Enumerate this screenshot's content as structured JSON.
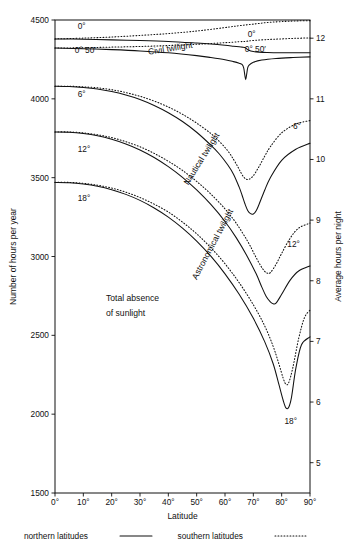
{
  "chart_data": {
    "type": "line",
    "title": "",
    "xlabel": "Latitude",
    "ylabel": "Number of hours per year",
    "ylabel_right": "Average hours per night",
    "xlim": [
      0,
      90
    ],
    "ylim": [
      1500,
      4500
    ],
    "ylim_right": [
      4.5,
      12.3
    ],
    "grid": false,
    "x_ticks": [
      "0°",
      "10°",
      "20°",
      "30°",
      "40°",
      "50°",
      "60°",
      "70°",
      "80°",
      "90°"
    ],
    "x_tick_values": [
      0,
      10,
      20,
      30,
      40,
      50,
      60,
      70,
      80,
      90
    ],
    "y_ticks": [
      "1500",
      "2000",
      "2500",
      "3000",
      "3500",
      "4000",
      "4500"
    ],
    "y_tick_values": [
      1500,
      2000,
      2500,
      3000,
      3500,
      4000,
      4500
    ],
    "y_ticks_right": [
      "5",
      "6",
      "7",
      "8",
      "9",
      "10",
      "11",
      "12"
    ],
    "y_tick_values_right": [
      5,
      6,
      7,
      8,
      9,
      10,
      11,
      12
    ],
    "legend": [
      {
        "label": "northern latitudes",
        "style": "solid"
      },
      {
        "label": "southern latitudes",
        "style": "dotted"
      }
    ],
    "legend_position": "below-axes",
    "zone_labels": [
      {
        "text": "Civil twilight",
        "x": 33,
        "y": 4280,
        "rotation": -9
      },
      {
        "text": "Nautical twilight",
        "x": 47,
        "y": 3450,
        "rotation": -58
      },
      {
        "text": "Astronomical twilight",
        "x": 50,
        "y": 2850,
        "rotation": -62
      },
      {
        "text": "Total absence",
        "x": 18,
        "y": 2720,
        "rotation": 0
      },
      {
        "text": "of sunlight",
        "x": 18,
        "y": 2620,
        "rotation": 0
      }
    ],
    "curve_labels_left": [
      {
        "text": "0°",
        "x": 8,
        "y": 4440
      },
      {
        "text": "0° 50′",
        "x": 7,
        "y": 4290
      },
      {
        "text": "6°",
        "x": 8,
        "y": 4010
      },
      {
        "text": "12°",
        "x": 8,
        "y": 3660
      },
      {
        "text": "18°",
        "x": 8,
        "y": 3350
      }
    ],
    "curve_labels_right": [
      {
        "text": "0°",
        "x": 68,
        "y": 4390
      },
      {
        "text": "0° 50′",
        "x": 67,
        "y": 4295
      },
      {
        "text": "6°",
        "x": 84,
        "y": 3810
      },
      {
        "text": "12°",
        "x": 82,
        "y": 3060
      },
      {
        "text": "18°",
        "x": 81,
        "y": 1940
      }
    ],
    "series": [
      {
        "name": "0° northern latitudes",
        "style": "solid",
        "altitude": "0°",
        "hemisphere": "northern",
        "x": [
          0,
          10,
          20,
          30,
          40,
          50,
          55,
          60,
          63,
          65,
          66,
          67,
          67.5,
          68,
          70,
          75,
          80,
          85,
          90
        ],
        "values": [
          4380,
          4378,
          4374,
          4370,
          4364,
          4354,
          4348,
          4340,
          4334,
          4330,
          4328,
          4326,
          4320,
          4312,
          4300,
          4294,
          4292,
          4292,
          4292
        ]
      },
      {
        "name": "0° southern latitudes",
        "style": "dotted",
        "altitude": "0°",
        "hemisphere": "southern",
        "x": [
          0,
          10,
          20,
          30,
          40,
          50,
          60,
          65,
          70,
          75,
          80,
          85,
          90
        ],
        "values": [
          4380,
          4385,
          4392,
          4402,
          4414,
          4430,
          4452,
          4464,
          4474,
          4484,
          4490,
          4494,
          4496
        ]
      },
      {
        "name": "0° 50′ northern latitudes",
        "style": "solid",
        "altitude": "0° 50′",
        "hemisphere": "northern",
        "x": [
          0,
          10,
          20,
          30,
          40,
          50,
          55,
          60,
          63,
          65,
          66,
          66.6,
          67,
          67.3,
          67.6,
          68,
          68.5,
          70,
          73,
          78,
          84,
          90
        ],
        "values": [
          4322,
          4318,
          4312,
          4304,
          4292,
          4274,
          4262,
          4248,
          4236,
          4226,
          4218,
          4196,
          4150,
          4122,
          4150,
          4196,
          4214,
          4232,
          4246,
          4256,
          4262,
          4266
        ]
      },
      {
        "name": "0° 50′ southern latitudes",
        "style": "dotted",
        "altitude": "0° 50′",
        "hemisphere": "southern",
        "x": [
          0,
          10,
          20,
          30,
          40,
          50,
          60,
          65,
          67,
          68,
          70,
          75,
          80,
          85,
          90
        ],
        "values": [
          4322,
          4324,
          4328,
          4332,
          4338,
          4346,
          4356,
          4362,
          4364,
          4366,
          4370,
          4376,
          4380,
          4384,
          4386
        ]
      },
      {
        "name": "6° northern latitudes",
        "style": "solid",
        "altitude": "6°",
        "hemisphere": "northern",
        "x": [
          0,
          5,
          10,
          15,
          20,
          25,
          30,
          35,
          40,
          45,
          50,
          55,
          58,
          61,
          63,
          65,
          66,
          67,
          68,
          69,
          70,
          71,
          72,
          74,
          76,
          80,
          85,
          90
        ],
        "values": [
          4080,
          4078,
          4072,
          4062,
          4046,
          4024,
          3996,
          3958,
          3912,
          3856,
          3788,
          3706,
          3650,
          3580,
          3522,
          3440,
          3390,
          3336,
          3292,
          3272,
          3270,
          3290,
          3330,
          3420,
          3500,
          3610,
          3680,
          3718
        ]
      },
      {
        "name": "6° southern latitudes",
        "style": "dotted",
        "altitude": "6°",
        "hemisphere": "southern",
        "x": [
          0,
          5,
          10,
          15,
          20,
          25,
          30,
          35,
          40,
          45,
          50,
          55,
          58,
          61,
          63,
          64.5,
          65.5,
          66.5,
          67.5,
          68.5,
          70,
          72,
          74,
          76,
          80,
          85,
          90
        ],
        "values": [
          4080,
          4080,
          4076,
          4070,
          4058,
          4040,
          4016,
          3986,
          3948,
          3902,
          3846,
          3780,
          3730,
          3670,
          3616,
          3570,
          3536,
          3506,
          3490,
          3490,
          3512,
          3570,
          3636,
          3696,
          3784,
          3840,
          3862
        ]
      },
      {
        "name": "12° northern latitudes",
        "style": "solid",
        "altitude": "12°",
        "hemisphere": "northern",
        "x": [
          0,
          5,
          10,
          15,
          20,
          25,
          30,
          35,
          40,
          45,
          50,
          55,
          60,
          64,
          68,
          71,
          73,
          74.5,
          76,
          77,
          78,
          80,
          83,
          86,
          90
        ],
        "values": [
          3790,
          3788,
          3780,
          3766,
          3744,
          3714,
          3676,
          3628,
          3570,
          3502,
          3422,
          3330,
          3222,
          3118,
          2996,
          2890,
          2806,
          2748,
          2712,
          2700,
          2704,
          2760,
          2850,
          2908,
          2940
        ]
      },
      {
        "name": "12° southern latitudes",
        "style": "dotted",
        "altitude": "12°",
        "hemisphere": "southern",
        "x": [
          0,
          5,
          10,
          15,
          20,
          25,
          30,
          35,
          40,
          45,
          50,
          55,
          60,
          64,
          68,
          70.5,
          72.5,
          74,
          75,
          76,
          78,
          80,
          83,
          86,
          90
        ],
        "values": [
          3790,
          3790,
          3784,
          3772,
          3754,
          3728,
          3696,
          3654,
          3604,
          3546,
          3476,
          3396,
          3302,
          3210,
          3096,
          3010,
          2944,
          2906,
          2894,
          2898,
          2950,
          3020,
          3116,
          3180,
          3212
        ]
      },
      {
        "name": "18° northern latitudes",
        "style": "solid",
        "altitude": "18°",
        "hemisphere": "northern",
        "x": [
          0,
          5,
          10,
          15,
          20,
          25,
          30,
          35,
          40,
          45,
          50,
          55,
          60,
          65,
          70,
          74,
          77,
          79,
          80.5,
          81.5,
          82.5,
          83.5,
          85,
          87,
          90
        ],
        "values": [
          3470,
          3468,
          3460,
          3446,
          3424,
          3394,
          3356,
          3308,
          3250,
          3180,
          3098,
          3002,
          2890,
          2760,
          2608,
          2460,
          2320,
          2190,
          2090,
          2040,
          2044,
          2110,
          2290,
          2440,
          2490
        ]
      },
      {
        "name": "18° southern latitudes",
        "style": "dotted",
        "altitude": "18°",
        "hemisphere": "southern",
        "x": [
          0,
          5,
          10,
          15,
          20,
          25,
          30,
          35,
          40,
          45,
          50,
          55,
          60,
          65,
          70,
          74,
          77,
          79,
          80.5,
          81.5,
          82.5,
          84,
          86,
          88,
          90
        ],
        "values": [
          3470,
          3470,
          3464,
          3452,
          3434,
          3408,
          3374,
          3332,
          3282,
          3218,
          3144,
          3056,
          2954,
          2834,
          2694,
          2560,
          2430,
          2320,
          2230,
          2190,
          2200,
          2300,
          2480,
          2610,
          2660
        ]
      }
    ]
  }
}
